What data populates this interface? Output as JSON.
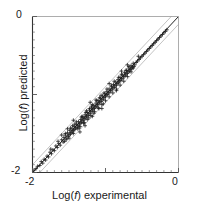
{
  "chart_data": {
    "type": "scatter",
    "title": "",
    "xlabel": "Log(f) experimental",
    "ylabel": "Log(f) predicted",
    "xlabel_prefix": "Log(",
    "xlabel_symbol": "f",
    "xlabel_suffix": ") experimental",
    "ylabel_prefix": "Log(",
    "ylabel_symbol": "f",
    "ylabel_suffix": ") predicted",
    "xlim": [
      -2,
      0
    ],
    "ylim": [
      -2,
      0
    ],
    "xticks": [
      -2,
      0
    ],
    "yticks": [
      -2,
      0
    ],
    "xtick_labels": [
      "-2",
      "0"
    ],
    "ytick_labels": [
      "-2",
      "0"
    ],
    "minor_tick_interval": 0.1,
    "major_tick_interval": 1.0,
    "grid": false,
    "legend": "none",
    "marker": "plus",
    "marker_color": "#1a1a1a",
    "identity_line": {
      "label": "y = x",
      "slope": 1,
      "intercept": 0,
      "color": "#222222"
    },
    "offset_lines": [
      {
        "label": "y = x + 0.1",
        "slope": 1,
        "intercept": 0.1,
        "color": "#b4b4b4"
      },
      {
        "label": "y = x - 0.1",
        "slope": 1,
        "intercept": -0.1,
        "color": "#b4b4b4"
      }
    ],
    "points": [
      [
        -1.98,
        -1.97
      ],
      [
        -1.95,
        -1.95
      ],
      [
        -1.93,
        -1.92
      ],
      [
        -1.9,
        -1.91
      ],
      [
        -1.88,
        -1.86
      ],
      [
        -1.86,
        -1.88
      ],
      [
        -1.84,
        -1.83
      ],
      [
        -1.82,
        -1.84
      ],
      [
        -1.8,
        -1.79
      ],
      [
        -1.78,
        -1.8
      ],
      [
        -1.76,
        -1.74
      ],
      [
        -1.74,
        -1.76
      ],
      [
        -1.72,
        -1.71
      ],
      [
        -1.7,
        -1.72
      ],
      [
        -1.68,
        -1.66
      ],
      [
        -1.66,
        -1.68
      ],
      [
        -1.64,
        -1.63
      ],
      [
        -1.62,
        -1.65
      ],
      [
        -1.6,
        -1.58
      ],
      [
        -1.58,
        -1.61
      ],
      [
        -1.57,
        -1.55
      ],
      [
        -1.56,
        -1.6
      ],
      [
        -1.55,
        -1.52
      ],
      [
        -1.54,
        -1.58
      ],
      [
        -1.53,
        -1.56
      ],
      [
        -1.52,
        -1.49
      ],
      [
        -1.51,
        -1.54
      ],
      [
        -1.5,
        -1.52
      ],
      [
        -1.49,
        -1.46
      ],
      [
        -1.48,
        -1.51
      ],
      [
        -1.47,
        -1.49
      ],
      [
        -1.46,
        -1.44
      ],
      [
        -1.45,
        -1.48
      ],
      [
        -1.44,
        -1.46
      ],
      [
        -1.43,
        -1.41
      ],
      [
        -1.42,
        -1.45
      ],
      [
        -1.41,
        -1.43
      ],
      [
        -1.4,
        -1.38
      ],
      [
        -1.39,
        -1.42
      ],
      [
        -1.38,
        -1.4
      ],
      [
        -1.37,
        -1.35
      ],
      [
        -1.36,
        -1.39
      ],
      [
        -1.35,
        -1.37
      ],
      [
        -1.34,
        -1.32
      ],
      [
        -1.33,
        -1.36
      ],
      [
        -1.32,
        -1.34
      ],
      [
        -1.31,
        -1.29
      ],
      [
        -1.3,
        -1.33
      ],
      [
        -1.29,
        -1.31
      ],
      [
        -1.28,
        -1.26
      ],
      [
        -1.27,
        -1.3
      ],
      [
        -1.26,
        -1.28
      ],
      [
        -1.25,
        -1.23
      ],
      [
        -1.24,
        -1.27
      ],
      [
        -1.23,
        -1.25
      ],
      [
        -1.22,
        -1.2
      ],
      [
        -1.21,
        -1.24
      ],
      [
        -1.2,
        -1.22
      ],
      [
        -1.19,
        -1.17
      ],
      [
        -1.18,
        -1.21
      ],
      [
        -1.17,
        -1.19
      ],
      [
        -1.16,
        -1.14
      ],
      [
        -1.15,
        -1.18
      ],
      [
        -1.14,
        -1.16
      ],
      [
        -1.13,
        -1.11
      ],
      [
        -1.12,
        -1.15
      ],
      [
        -1.11,
        -1.13
      ],
      [
        -1.1,
        -1.08
      ],
      [
        -1.09,
        -1.12
      ],
      [
        -1.08,
        -1.1
      ],
      [
        -1.07,
        -1.05
      ],
      [
        -1.06,
        -1.09
      ],
      [
        -1.05,
        -1.07
      ],
      [
        -1.04,
        -1.02
      ],
      [
        -1.03,
        -1.06
      ],
      [
        -1.02,
        -1.04
      ],
      [
        -1.01,
        -0.99
      ],
      [
        -1.0,
        -1.03
      ],
      [
        -0.99,
        -1.01
      ],
      [
        -0.98,
        -0.96
      ],
      [
        -0.97,
        -1.0
      ],
      [
        -0.96,
        -0.98
      ],
      [
        -0.95,
        -0.93
      ],
      [
        -0.94,
        -0.97
      ],
      [
        -0.93,
        -0.95
      ],
      [
        -0.92,
        -0.9
      ],
      [
        -0.91,
        -0.94
      ],
      [
        -0.9,
        -0.92
      ],
      [
        -0.89,
        -0.87
      ],
      [
        -0.88,
        -0.91
      ],
      [
        -0.87,
        -0.89
      ],
      [
        -0.86,
        -0.84
      ],
      [
        -0.85,
        -0.88
      ],
      [
        -0.84,
        -0.86
      ],
      [
        -0.83,
        -0.81
      ],
      [
        -0.82,
        -0.85
      ],
      [
        -0.81,
        -0.83
      ],
      [
        -0.8,
        -0.78
      ],
      [
        -0.79,
        -0.82
      ],
      [
        -0.78,
        -0.8
      ],
      [
        -0.77,
        -0.75
      ],
      [
        -0.76,
        -0.79
      ],
      [
        -0.75,
        -0.77
      ],
      [
        -0.74,
        -0.72
      ],
      [
        -0.73,
        -0.76
      ],
      [
        -0.72,
        -0.74
      ],
      [
        -0.71,
        -0.69
      ],
      [
        -0.7,
        -0.73
      ],
      [
        -0.69,
        -0.71
      ],
      [
        -0.68,
        -0.66
      ],
      [
        -0.67,
        -0.7
      ],
      [
        -0.66,
        -0.68
      ],
      [
        -0.65,
        -0.63
      ],
      [
        -0.64,
        -0.67
      ],
      [
        -0.63,
        -0.65
      ],
      [
        -0.62,
        -0.6
      ],
      [
        -0.61,
        -0.64
      ],
      [
        -0.6,
        -0.62
      ],
      [
        -0.58,
        -0.59
      ],
      [
        -0.56,
        -0.57
      ],
      [
        -0.54,
        -0.55
      ],
      [
        -0.52,
        -0.53
      ],
      [
        -0.5,
        -0.51
      ],
      [
        -0.48,
        -0.49
      ],
      [
        -0.46,
        -0.47
      ],
      [
        -0.44,
        -0.45
      ],
      [
        -0.42,
        -0.43
      ],
      [
        -0.4,
        -0.41
      ],
      [
        -0.38,
        -0.39
      ],
      [
        -0.36,
        -0.37
      ],
      [
        -0.34,
        -0.35
      ],
      [
        -0.32,
        -0.33
      ],
      [
        -0.3,
        -0.31
      ],
      [
        -0.28,
        -0.29
      ],
      [
        -0.26,
        -0.27
      ],
      [
        -0.24,
        -0.25
      ],
      [
        -0.22,
        -0.23
      ],
      [
        -0.2,
        -0.21
      ],
      [
        -0.18,
        -0.19
      ],
      [
        -0.16,
        -0.17
      ],
      [
        -1.45,
        -1.4
      ],
      [
        -1.42,
        -1.38
      ],
      [
        -1.38,
        -1.44
      ],
      [
        -1.35,
        -1.41
      ],
      [
        -1.32,
        -1.28
      ],
      [
        -1.3,
        -1.37
      ],
      [
        -1.27,
        -1.23
      ],
      [
        -1.25,
        -1.32
      ],
      [
        -1.22,
        -1.18
      ],
      [
        -1.2,
        -1.27
      ],
      [
        -1.18,
        -1.13
      ],
      [
        -1.15,
        -1.22
      ],
      [
        -1.12,
        -1.08
      ],
      [
        -1.1,
        -1.17
      ],
      [
        -1.08,
        -1.04
      ],
      [
        -1.05,
        -1.13
      ],
      [
        -1.02,
        -0.98
      ],
      [
        -1.0,
        -1.08
      ],
      [
        -0.98,
        -0.93
      ],
      [
        -0.95,
        -1.03
      ],
      [
        -0.92,
        -0.88
      ],
      [
        -0.9,
        -0.98
      ],
      [
        -0.88,
        -0.83
      ],
      [
        -0.85,
        -0.93
      ],
      [
        -0.82,
        -0.78
      ],
      [
        -0.8,
        -0.88
      ],
      [
        -0.78,
        -0.74
      ],
      [
        -0.75,
        -0.83
      ],
      [
        -0.72,
        -0.69
      ],
      [
        -0.7,
        -0.77
      ],
      [
        -0.68,
        -0.64
      ],
      [
        -0.65,
        -0.71
      ],
      [
        -1.55,
        -1.5
      ],
      [
        -1.5,
        -1.56
      ],
      [
        -1.48,
        -1.43
      ],
      [
        -1.44,
        -1.5
      ],
      [
        -1.4,
        -1.35
      ],
      [
        -1.36,
        -1.43
      ],
      [
        -1.33,
        -1.29
      ],
      [
        -1.29,
        -1.36
      ],
      [
        -1.26,
        -1.21
      ],
      [
        -1.23,
        -1.3
      ],
      [
        -1.19,
        -1.15
      ],
      [
        -1.16,
        -1.24
      ],
      [
        -1.13,
        -1.07
      ],
      [
        -1.09,
        -1.18
      ],
      [
        -1.06,
        -1.01
      ],
      [
        -1.03,
        -1.12
      ],
      [
        -0.85,
        -0.95
      ],
      [
        -0.78,
        -0.7
      ],
      [
        -0.62,
        -0.66
      ],
      [
        -0.55,
        -0.51
      ],
      [
        -1.21,
        -1.1
      ],
      [
        -1.18,
        -1.28
      ],
      [
        -1.44,
        -1.33
      ],
      [
        -1.28,
        -1.4
      ],
      [
        -1.05,
        -1.18
      ],
      [
        -0.95,
        -0.86
      ],
      [
        -1.35,
        -1.48
      ],
      [
        -1.6,
        -1.52
      ],
      [
        -0.7,
        -0.62
      ],
      [
        -1.52,
        -1.44
      ],
      [
        -1.65,
        -1.6
      ],
      [
        -1.75,
        -1.7
      ]
    ]
  },
  "axis": {
    "y_top_label": "0",
    "y_bottom_label": "-2",
    "x_left_label": "-2",
    "x_right_label": "0"
  }
}
